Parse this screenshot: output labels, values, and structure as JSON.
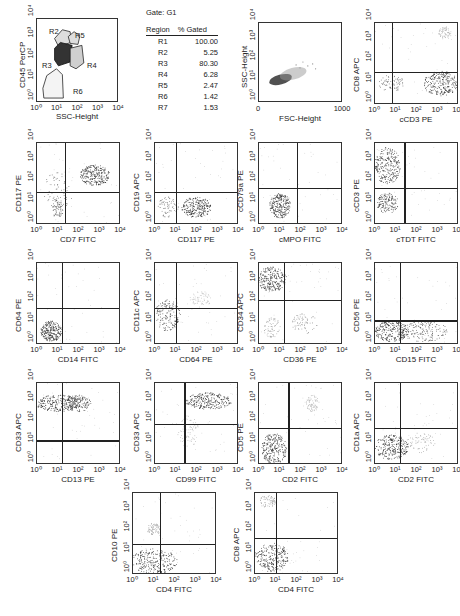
{
  "gate_table": {
    "gate": "Gate: G1",
    "header": {
      "region": "Region",
      "pct": "% Gated"
    },
    "rows": [
      {
        "region": "R1",
        "pct": "100.00"
      },
      {
        "region": "R2",
        "pct": "5.25"
      },
      {
        "region": "R3",
        "pct": "80.30"
      },
      {
        "region": "R4",
        "pct": "6.28"
      },
      {
        "region": "R5",
        "pct": "2.47"
      },
      {
        "region": "R6",
        "pct": "1.42"
      },
      {
        "region": "R7",
        "pct": "1.53"
      }
    ]
  },
  "gating_plot": {
    "xlabel": "SSC-Height",
    "ylabel": "CD45 PerCP",
    "regions": [
      "R2",
      "R5",
      "R3",
      "R4",
      "R6"
    ]
  },
  "fsc_plot": {
    "xlabel": "FSC-Height",
    "ylabel": "SSC-Height",
    "xticks": [
      "0",
      "1000"
    ]
  },
  "log_ticks": [
    "10⁰",
    "10¹",
    "10²",
    "10³",
    "10⁴"
  ],
  "panels": [
    {
      "id": "p1",
      "x": "cCD3 PE",
      "y": "CD8 APC"
    },
    {
      "id": "p2",
      "x": "CD7 FITC",
      "y": "CD117 PE"
    },
    {
      "id": "p3",
      "x": "CD117 PE",
      "y": "CD19 APC"
    },
    {
      "id": "p4",
      "x": "cMPO FITC",
      "y": "cCD79a PE"
    },
    {
      "id": "p5",
      "x": "cTDT FITC",
      "y": "cCD3 PE"
    },
    {
      "id": "p6",
      "x": "CD14 FITC",
      "y": "CD64 PE"
    },
    {
      "id": "p7",
      "x": "CD64 PE",
      "y": "CD11c APC"
    },
    {
      "id": "p8",
      "x": "CD36 PE",
      "y": "CD34 APC"
    },
    {
      "id": "p9",
      "x": "CD15 FITC",
      "y": "CD56 PE"
    },
    {
      "id": "p10",
      "x": "CD13 PE",
      "y": "CD33 APC"
    },
    {
      "id": "p11",
      "x": "CD99 FITC",
      "y": "CD33 APC"
    },
    {
      "id": "p12",
      "x": "CD2 FITC",
      "y": "CD5 PE"
    },
    {
      "id": "p13",
      "x": "CD2 FITC",
      "y": "CD1a APC"
    },
    {
      "id": "p14",
      "x": "CD4 FITC",
      "y": "CD10 PE"
    },
    {
      "id": "p15",
      "x": "CD4 FITC",
      "y": "CD8 APC"
    }
  ],
  "chart_data": [
    {
      "type": "table",
      "title": "Gate: G1",
      "columns": [
        "Region",
        "% Gated"
      ],
      "rows": [
        [
          "R1",
          100.0
        ],
        [
          "R2",
          5.25
        ],
        [
          "R3",
          80.3
        ],
        [
          "R4",
          6.28
        ],
        [
          "R5",
          2.47
        ],
        [
          "R6",
          1.42
        ],
        [
          "R7",
          1.53
        ]
      ]
    },
    {
      "type": "scatter",
      "title": "Gating plot",
      "xlabel": "SSC-Height",
      "ylabel": "CD45 PerCP",
      "xscale": "log",
      "yscale": "log",
      "xlim": [
        1,
        10000
      ],
      "ylim": [
        1,
        10000
      ],
      "annotations": [
        "R2",
        "R3",
        "R4",
        "R5",
        "R6"
      ],
      "main_population": "R3 at SSC ~10, CD45 ~100"
    },
    {
      "type": "scatter",
      "xlabel": "FSC-Height",
      "ylabel": "SSC-Height",
      "xlim": [
        0,
        1000
      ],
      "yscale": "log",
      "ylim": [
        1,
        10000
      ],
      "population": "FSC ~200-450, SSC ~10-50"
    },
    {
      "type": "scatter",
      "xlabel": "cCD3 PE",
      "ylabel": "CD8 APC",
      "xscale": "log",
      "yscale": "log",
      "quadrant": {
        "x": 20,
        "y": 40
      },
      "populations": [
        "cCD3+ CD8- at ~1000,10",
        "cCD3- CD8- at ~5,10",
        "small CD8+ cCD3+ at ~1000,1000"
      ]
    },
    {
      "type": "scatter",
      "xlabel": "CD7 FITC",
      "ylabel": "CD117 PE",
      "xscale": "log",
      "yscale": "log",
      "quadrant": {
        "x": 20,
        "y": 15
      },
      "populations": [
        "CD7+ CD117+ at ~500,100",
        "CD7- at ~10"
      ]
    },
    {
      "type": "scatter",
      "xlabel": "CD117 PE",
      "ylabel": "CD19 APC",
      "xscale": "log",
      "yscale": "log",
      "quadrant": {
        "x": 15,
        "y": 15
      },
      "populations": [
        "CD19- CD117+ at ~100,3"
      ]
    },
    {
      "type": "scatter",
      "xlabel": "cMPO FITC",
      "ylabel": "cCD79a PE",
      "xscale": "log",
      "yscale": "log",
      "quadrant": {
        "x": 30,
        "y": 30
      },
      "populations": [
        "double negative at ~8,8"
      ]
    },
    {
      "type": "scatter",
      "xlabel": "cTDT FITC",
      "ylabel": "cCD3 PE",
      "xscale": "log",
      "yscale": "log",
      "quadrant": {
        "x": 25,
        "y": 25
      },
      "populations": [
        "cCD3+ TdT- at ~5,500",
        "cCD3- at ~5,10"
      ]
    },
    {
      "type": "scatter",
      "xlabel": "CD14 FITC",
      "ylabel": "CD64 PE",
      "xscale": "log",
      "yscale": "log",
      "quadrant": {
        "x": 15,
        "y": 25
      },
      "populations": [
        "double negative at ~5,3"
      ]
    },
    {
      "type": "scatter",
      "xlabel": "CD64 PE",
      "ylabel": "CD11c APC",
      "xscale": "log",
      "yscale": "log",
      "quadrant": {
        "x": 15,
        "y": 25
      },
      "populations": [
        "double negative at ~3,15"
      ]
    },
    {
      "type": "scatter",
      "xlabel": "CD36 PE",
      "ylabel": "CD34 APC",
      "xscale": "log",
      "yscale": "log",
      "quadrant": {
        "x": 20,
        "y": 40
      },
      "populations": [
        "CD34+ CD36- at ~3,800",
        "CD34- CD36+ at ~100,10"
      ]
    },
    {
      "type": "scatter",
      "xlabel": "CD15 FITC",
      "ylabel": "CD56 PE",
      "xscale": "log",
      "yscale": "log",
      "quadrant": {
        "x": 20,
        "y": 15
      },
      "populations": [
        "CD56- spread across CD15 at ~1-1000,3"
      ]
    },
    {
      "type": "scatter",
      "xlabel": "CD13 PE",
      "ylabel": "CD33 APC",
      "xscale": "log",
      "yscale": "log",
      "quadrant": {
        "x": 15,
        "y": 15
      },
      "populations": [
        "CD33+ at ~10,500"
      ]
    },
    {
      "type": "scatter",
      "xlabel": "CD99 FITC",
      "ylabel": "CD33 APC",
      "xscale": "log",
      "yscale": "log",
      "quadrant": {
        "x": 30,
        "y": 50
      },
      "populations": [
        "CD33+ CD99+ at ~200,600"
      ]
    },
    {
      "type": "scatter",
      "xlabel": "CD2 FITC",
      "ylabel": "CD5 PE",
      "xscale": "log",
      "yscale": "log",
      "quadrant": {
        "x": 20,
        "y": 25
      },
      "populations": [
        "double negative at ~5,5",
        "small CD2+ CD5+ at ~300,800"
      ]
    },
    {
      "type": "scatter",
      "xlabel": "CD2 FITC",
      "ylabel": "CD1a APC",
      "xscale": "log",
      "yscale": "log",
      "quadrant": {
        "x": 20,
        "y": 25
      },
      "populations": [
        "double negative at ~5,5"
      ]
    },
    {
      "type": "scatter",
      "xlabel": "CD4 FITC",
      "ylabel": "CD10 PE",
      "xscale": "log",
      "yscale": "log",
      "quadrant": {
        "x": 20,
        "y": 15
      },
      "populations": [
        "double negative at ~10,2"
      ]
    },
    {
      "type": "scatter",
      "xlabel": "CD4 FITC",
      "ylabel": "CD8 APC",
      "xscale": "log",
      "yscale": "log",
      "quadrant": {
        "x": 10,
        "y": 25
      },
      "populations": [
        "double negative at ~10,5",
        "small CD8+ at ~5,3000"
      ]
    }
  ]
}
